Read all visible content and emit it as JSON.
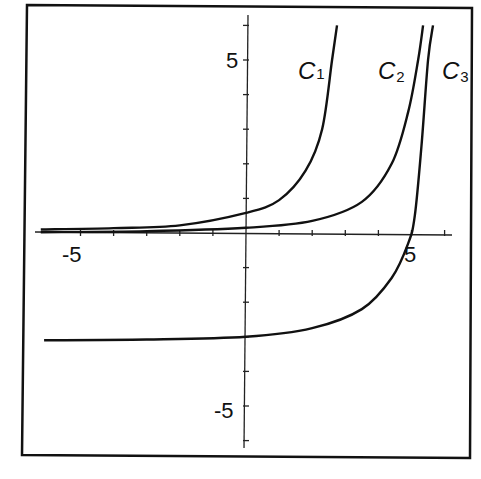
{
  "chart_data": {
    "type": "line",
    "title": "",
    "xlabel": "",
    "ylabel": "",
    "xlim": [
      -6.2,
      6.5
    ],
    "ylim": [
      -6.4,
      6.6
    ],
    "x_tick_labels": [
      "-5",
      "5"
    ],
    "y_tick_labels": [
      "5",
      "-5"
    ],
    "grid": false,
    "legend": "none (curves labeled inline)",
    "series": [
      {
        "name": "C1",
        "label": "C",
        "subscript": "1",
        "points": [
          [
            -6.2,
            0.1
          ],
          [
            -4,
            0.14
          ],
          [
            -2,
            0.22
          ],
          [
            0,
            0.58
          ],
          [
            1,
            0.95
          ],
          [
            1.8,
            1.8
          ],
          [
            2.3,
            3.0
          ],
          [
            2.6,
            5.0
          ],
          [
            2.75,
            6.0
          ]
        ]
      },
      {
        "name": "C2",
        "label": "C",
        "subscript": "2",
        "points": [
          [
            -6.2,
            0.02
          ],
          [
            -3,
            0.05
          ],
          [
            0,
            0.15
          ],
          [
            2,
            0.35
          ],
          [
            3.5,
            0.9
          ],
          [
            4.4,
            2.0
          ],
          [
            4.9,
            3.5
          ],
          [
            5.2,
            5.0
          ],
          [
            5.35,
            6.0
          ]
        ]
      },
      {
        "name": "C3",
        "label": "C",
        "subscript": "3",
        "points": [
          [
            -6.1,
            -3.1
          ],
          [
            -3,
            -3.08
          ],
          [
            0,
            -3.0
          ],
          [
            2,
            -2.75
          ],
          [
            3.5,
            -2.2
          ],
          [
            4.4,
            -1.3
          ],
          [
            4.9,
            -0.3
          ],
          [
            5.1,
            0.5
          ],
          [
            5.3,
            2.5
          ],
          [
            5.5,
            5.0
          ],
          [
            5.65,
            6.0
          ]
        ]
      }
    ]
  },
  "labels": {
    "x_neg5": "-5",
    "x_pos5": "5",
    "y_pos5": "5",
    "y_neg5": "-5",
    "c1": "C",
    "c1_sub": "1",
    "c2": "C",
    "c2_sub": "2",
    "c3": "C",
    "c3_sub": "3"
  }
}
